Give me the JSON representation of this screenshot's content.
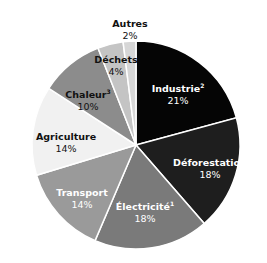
{
  "chart_data": {
    "type": "pie",
    "title": "",
    "start_angle": "top",
    "direction": "clockwise",
    "slices": [
      {
        "label": "Industrie",
        "sup": "2",
        "value": 21,
        "pct_label": "21%",
        "color": "#050505",
        "text_color": "#ffffff",
        "pct_color": "#ffffff"
      },
      {
        "label": "Déforestation",
        "sup": "",
        "value": 18,
        "pct_label": "18%",
        "color": "#1e1e1e",
        "text_color": "#ffffff",
        "pct_color": "#ffffff"
      },
      {
        "label": "Électricité",
        "sup": "1",
        "value": 18,
        "pct_label": "18%",
        "color": "#7a7a7a",
        "text_color": "#ffffff",
        "pct_color": "#ffffff"
      },
      {
        "label": "Transport",
        "sup": "",
        "value": 14,
        "pct_label": "14%",
        "color": "#9a9a9a",
        "text_color": "#ffffff",
        "pct_color": "#ffffff"
      },
      {
        "label": "Agriculture",
        "sup": "",
        "value": 14,
        "pct_label": "14%",
        "color": "#f1f1f1",
        "text_color": "#111111",
        "pct_color": "#111111"
      },
      {
        "label": "Chaleur",
        "sup": "3",
        "value": 10,
        "pct_label": "10%",
        "color": "#8c8c8c",
        "text_color": "#111111",
        "pct_color": "#111111"
      },
      {
        "label": "Déchets",
        "sup": "",
        "value": 4,
        "pct_label": "4%",
        "color": "#c4c4c4",
        "text_color": "#111111",
        "pct_color": "#111111"
      },
      {
        "label": "Autres",
        "sup": "",
        "value": 2,
        "pct_label": "2%",
        "color": "#d6d6d6",
        "text_color": "#111111",
        "pct_color": "#111111"
      }
    ],
    "label_positions": [
      {
        "x": 178,
        "y": 92
      },
      {
        "x": 210,
        "y": 166
      },
      {
        "x": 145,
        "y": 210
      },
      {
        "x": 82,
        "y": 196
      },
      {
        "x": 66,
        "y": 140
      },
      {
        "x": 88,
        "y": 98
      },
      {
        "x": 116,
        "y": 63
      },
      {
        "x": 130,
        "y": 27
      }
    ],
    "legend": "none",
    "grid": false
  },
  "geometry": {
    "cx": 136,
    "cy": 145,
    "r": 104,
    "stroke": "#ffffff"
  }
}
